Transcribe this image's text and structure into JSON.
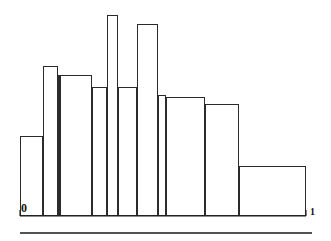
{
  "figure": {
    "background_color": "#ffffff",
    "ink_color": "#1a1a1a",
    "axis_color": "#1a1a1a",
    "bar_fill": "none",
    "bar_stroke": "#2b2b2b"
  },
  "axis": {
    "left_tick_label": "0",
    "right_tick_label": "1",
    "baseline_y_px": 216,
    "x_start_px": 20,
    "x_end_px": 306
  },
  "separator": {
    "name": "horizontal-rule",
    "y_px": 233,
    "x_start_px": 20,
    "x_end_px": 312,
    "color": "#1a1a1a"
  },
  "chart_data": {
    "type": "bar",
    "title": "",
    "subtitle": "",
    "xlabel": "",
    "ylabel": "",
    "grid": false,
    "legend": null,
    "xlim": [
      0,
      1
    ],
    "ylim": [
      0,
      1
    ],
    "axis_tick_labels": [
      "0",
      "1"
    ],
    "note": "Variable-width histogram (density estimate) drawn as unfilled rectangles on the interval 0 to 1.",
    "bin_edges": [
      0.0,
      0.08,
      0.133,
      0.14,
      0.252,
      0.304,
      0.343,
      0.409,
      0.483,
      0.511,
      0.647,
      0.766,
      1.0
    ],
    "bin_edges_px": [
      20,
      43,
      58,
      60,
      92,
      107,
      118,
      137,
      158,
      166,
      205,
      239,
      306
    ],
    "values": [
      0.4,
      0.75,
      0.7,
      0.642,
      1.0,
      0.642,
      0.955,
      0.602,
      0.592,
      0.557,
      0.489,
      0.249
    ],
    "values_px_top": [
      136,
      66,
      75,
      87,
      15,
      87,
      24,
      95,
      97,
      104,
      117,
      166
    ],
    "bars": [
      {
        "index": 1,
        "x0": 0.0,
        "x1": 0.08,
        "x0_px": 20,
        "x1_px": 43,
        "top_px": 136,
        "height": 0.4
      },
      {
        "index": 2,
        "x0": 0.08,
        "x1": 0.133,
        "x0_px": 43,
        "x1_px": 58,
        "top_px": 66,
        "height": 0.75
      },
      {
        "index": 3,
        "x0": 0.133,
        "x1": 0.14,
        "x0_px": 58,
        "x1_px": 60,
        "top_px": 75,
        "height": 0.7
      },
      {
        "index": 4,
        "x0": 0.14,
        "x1": 0.252,
        "x0_px": 60,
        "x1_px": 92,
        "top_px": 75,
        "height": 0.7
      },
      {
        "index": 5,
        "x0": 0.252,
        "x1": 0.304,
        "x0_px": 92,
        "x1_px": 107,
        "top_px": 87,
        "height": 0.642
      },
      {
        "index": 6,
        "x0": 0.304,
        "x1": 0.343,
        "x0_px": 107,
        "x1_px": 118,
        "top_px": 15,
        "height": 1.0
      },
      {
        "index": 7,
        "x0": 0.343,
        "x1": 0.409,
        "x0_px": 118,
        "x1_px": 137,
        "top_px": 87,
        "height": 0.642
      },
      {
        "index": 8,
        "x0": 0.409,
        "x1": 0.483,
        "x0_px": 137,
        "x1_px": 158,
        "top_px": 24,
        "height": 0.955
      },
      {
        "index": 9,
        "x0": 0.483,
        "x1": 0.511,
        "x0_px": 158,
        "x1_px": 166,
        "top_px": 95,
        "height": 0.602
      },
      {
        "index": 10,
        "x0": 0.511,
        "x1": 0.647,
        "x0_px": 166,
        "x1_px": 205,
        "top_px": 97,
        "height": 0.592
      },
      {
        "index": 11,
        "x0": 0.647,
        "x1": 0.766,
        "x0_px": 205,
        "x1_px": 239,
        "top_px": 104,
        "height": 0.557
      },
      {
        "index": 12,
        "x0": 0.766,
        "x1": 1.0,
        "x0_px": 239,
        "x1_px": 306,
        "top_px": 166,
        "height": 0.249
      }
    ]
  }
}
